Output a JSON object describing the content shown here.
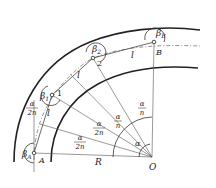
{
  "diagram": {
    "type": "curved track / polygon approximation geometry",
    "points": {
      "A": "A",
      "B": "B",
      "O": "O",
      "p1": "1",
      "p2": "2"
    },
    "angles": {
      "beta_A": "β_A",
      "beta_1": "β_1",
      "beta_2": "β_2",
      "beta_B": "β_B",
      "alpha": "α"
    },
    "labels": {
      "segment": "l",
      "radius": "R",
      "half_angle_num": "α",
      "half_angle_den": "2n",
      "angle_num": "α",
      "angle_den": "n",
      "beta_sym": "β",
      "sub_A": "A",
      "sub_1": "1",
      "sub_2": "2",
      "sub_B": "B"
    },
    "colors": {
      "stroke": "#222222",
      "thin": "#444444",
      "dash": "#666666"
    }
  }
}
